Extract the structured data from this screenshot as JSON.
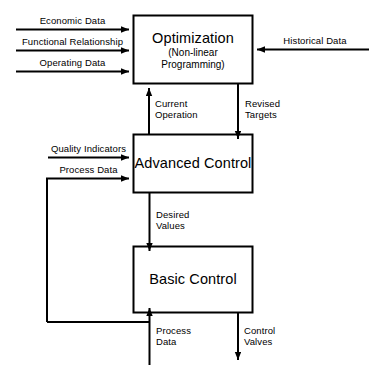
{
  "diagram": {
    "type": "block-flow-diagram",
    "colors": {
      "stroke": "#000000",
      "background": "#ffffff",
      "text": "#000000"
    },
    "boxes": [
      {
        "id": "optimization",
        "title": "Optimization",
        "subtitle_line1": "(Non-linear",
        "subtitle_line2": "Programming)"
      },
      {
        "id": "advanced-control",
        "title": "Advanced Control"
      },
      {
        "id": "basic-control",
        "title": "Basic Control"
      }
    ],
    "edges": [
      {
        "id": "economic-data",
        "label": "Economic Data",
        "direction": "right",
        "target": "optimization"
      },
      {
        "id": "functional-relationship",
        "label": "Functional Relationship",
        "direction": "right",
        "target": "optimization"
      },
      {
        "id": "operating-data",
        "label": "Operating Data",
        "direction": "right",
        "target": "optimization"
      },
      {
        "id": "historical-data",
        "label": "Historical Data",
        "direction": "left",
        "target": "optimization"
      },
      {
        "id": "current-operation",
        "label_line1": "Current",
        "label_line2": "Operation",
        "direction": "up",
        "source": "advanced-control",
        "target": "optimization"
      },
      {
        "id": "revised-targets",
        "label_line1": "Revised",
        "label_line2": "Targets",
        "direction": "down",
        "source": "optimization",
        "target": "advanced-control"
      },
      {
        "id": "quality-indicators",
        "label": "Quality Indicators",
        "direction": "right",
        "target": "advanced-control"
      },
      {
        "id": "process-data-feedback",
        "label": "Process Data",
        "direction": "right",
        "target": "advanced-control"
      },
      {
        "id": "desired-values",
        "label_line1": "Desired",
        "label_line2": "Values",
        "direction": "down",
        "source": "advanced-control",
        "target": "basic-control"
      },
      {
        "id": "process-data-input",
        "label_line1": "Process",
        "label_line2": "Data",
        "direction": "up",
        "target": "basic-control"
      },
      {
        "id": "control-valves",
        "label_line1": "Control",
        "label_line2": "Valves",
        "direction": "down",
        "source": "basic-control"
      }
    ]
  }
}
